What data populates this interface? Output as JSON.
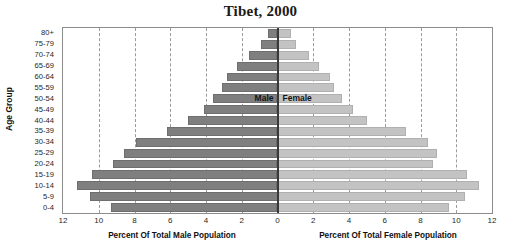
{
  "chart_data": {
    "type": "bar",
    "subtype": "population-pyramid",
    "title": "Tibet, 2000",
    "xlabel_left": "Percent Of Total Male Population",
    "xlabel_right": "Percent Of Total Female Population",
    "ylabel": "Age Group",
    "grid": true,
    "legend_position": "inside-center",
    "xlim": [
      -12,
      12
    ],
    "xtick_labels_left": [
      "12",
      "10",
      "8",
      "6",
      "4",
      "2",
      "0"
    ],
    "xtick_labels_right": [
      "2",
      "4",
      "6",
      "8",
      "10",
      "12"
    ],
    "xticks": [
      12,
      10,
      8,
      6,
      4,
      2,
      0,
      2,
      4,
      6,
      8,
      10,
      12
    ],
    "categories": [
      "80+",
      "75-79",
      "70-74",
      "65-69",
      "60-64",
      "55-59",
      "50-54",
      "45-49",
      "40-44",
      "35-39",
      "30-34",
      "25-29",
      "20-24",
      "15-19",
      "10-14",
      "5-9",
      "0-4"
    ],
    "series": [
      {
        "name": "Male",
        "color": "#7f7f7f",
        "direction": "left",
        "values": [
          0.55,
          0.95,
          1.6,
          2.25,
          2.8,
          3.1,
          3.6,
          4.1,
          5.0,
          6.2,
          7.9,
          8.6,
          9.2,
          10.4,
          11.2,
          10.5,
          9.3
        ]
      },
      {
        "name": "Female",
        "color": "#c3c3c3",
        "direction": "right",
        "values": [
          0.75,
          1.05,
          1.75,
          2.3,
          2.95,
          3.15,
          3.6,
          4.2,
          5.0,
          7.2,
          8.4,
          8.95,
          8.7,
          10.6,
          11.3,
          10.5,
          9.6
        ]
      }
    ]
  }
}
